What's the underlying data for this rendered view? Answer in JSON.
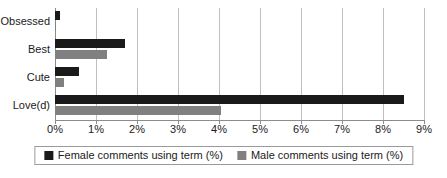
{
  "chart_data": {
    "type": "bar",
    "orientation": "horizontal",
    "title": "",
    "xlabel": "",
    "ylabel": "",
    "categories": [
      "Obsessed",
      "Best",
      "Cute",
      "Love(d)"
    ],
    "series": [
      {
        "name": "Female comments using term (%)",
        "color": "#1a1a1a",
        "values": [
          0.12,
          1.7,
          0.58,
          8.5
        ]
      },
      {
        "name": "Male comments using term (%)",
        "color": "#808080",
        "values": [
          0.02,
          1.28,
          0.22,
          4.05
        ]
      }
    ],
    "xlim": [
      0,
      9
    ],
    "xtick_values": [
      0,
      1,
      2,
      3,
      4,
      5,
      6,
      7,
      8,
      9
    ],
    "xtick_labels": [
      "0%",
      "1%",
      "2%",
      "3%",
      "4%",
      "5%",
      "6%",
      "7%",
      "8%",
      "9%"
    ],
    "grid": true,
    "grid_axis": "x",
    "legend_position": "bottom"
  },
  "legend": {
    "items": [
      {
        "label": "Female comments using term (%)",
        "swatch": "legend-swatch-female"
      },
      {
        "label": "Male comments using term (%)",
        "swatch": "legend-swatch-male"
      }
    ]
  },
  "colors": {
    "female": "#1a1a1a",
    "male": "#808080",
    "grid": "#bfbfbf",
    "axis": "#8c8c8c",
    "background": "#ffffff"
  }
}
